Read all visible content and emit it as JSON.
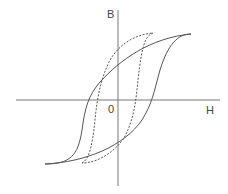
{
  "diagram": {
    "type": "hysteresis-loop",
    "axes": {
      "x_label": "H",
      "y_label": "B",
      "origin_label": "0"
    },
    "curves": [
      {
        "name": "major-loop",
        "style": "solid"
      },
      {
        "name": "minor-loop",
        "style": "dashed"
      }
    ],
    "colors": {
      "line": "#555555",
      "axis": "#777777",
      "text": "#444444"
    }
  }
}
